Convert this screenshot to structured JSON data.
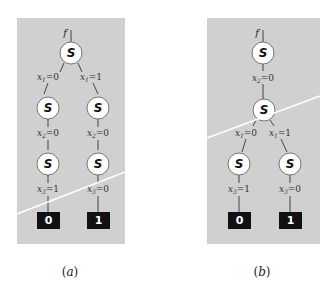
{
  "figure": {
    "panels": [
      {
        "id": "a",
        "caption_open": "(",
        "caption_letter": "a",
        "caption_close": ")",
        "root_label": "f",
        "node_symbol": "S",
        "levels": [
          {
            "labels": [
              {
                "var": "x",
                "sub": "1",
                "val": "=0"
              },
              {
                "var": "x",
                "sub": "1",
                "val": "=1"
              }
            ]
          },
          {
            "labels": [
              {
                "var": "x",
                "sub": "2",
                "val": "=0"
              },
              {
                "var": "x",
                "sub": "2",
                "val": "=0"
              }
            ]
          },
          {
            "labels": [
              {
                "var": "x",
                "sub": "3",
                "val": "=1"
              },
              {
                "var": "x",
                "sub": "3",
                "val": "=0"
              }
            ]
          }
        ],
        "terminals": [
          "0",
          "1"
        ]
      },
      {
        "id": "b",
        "caption_open": "(",
        "caption_letter": "b",
        "caption_close": ")",
        "root_label": "f",
        "node_symbol": "S",
        "levels": [
          {
            "labels": [
              {
                "var": "x",
                "sub": "2",
                "val": "=0"
              }
            ]
          },
          {
            "labels": [
              {
                "var": "x",
                "sub": "1",
                "val": "=0"
              },
              {
                "var": "x",
                "sub": "1",
                "val": "=1"
              }
            ]
          },
          {
            "labels": [
              {
                "var": "x",
                "sub": "3",
                "val": "=1"
              },
              {
                "var": "x",
                "sub": "3",
                "val": "=0"
              }
            ]
          }
        ],
        "terminals": [
          "0",
          "1"
        ]
      }
    ],
    "colors": {
      "panel_bg": "#d0d0d0",
      "node_fill": "#ffffff",
      "terminal_fill": "#111111",
      "cut_line": "#ffffff"
    }
  }
}
